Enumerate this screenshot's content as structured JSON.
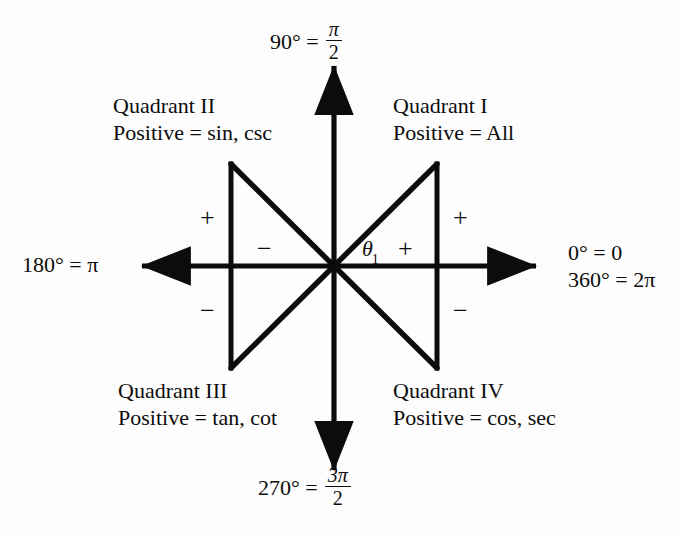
{
  "diagram": {
    "background_color": "#fdfdfd",
    "line_color": "#0c0c0c"
  },
  "axis_labels": {
    "top": {
      "name": "90-degrees-label",
      "degrees": "90° =",
      "radian_numerator": "π",
      "radian_denominator": "2"
    },
    "bottom": {
      "name": "270-degrees-label",
      "degrees": "270° =",
      "radian_numerator": "3π",
      "radian_denominator": "2"
    },
    "left": {
      "name": "180-degrees-label",
      "text": "180° = π"
    },
    "right": {
      "name": "0-and-360-degrees-label",
      "line1": "0° = 0",
      "line2": "360° = 2π"
    }
  },
  "quadrants": [
    {
      "id": "quadrant-1",
      "title": "Quadrant I",
      "positive": "Positive = All",
      "functions": "All"
    },
    {
      "id": "quadrant-2",
      "title": "Quadrant II",
      "positive": "Positive = sin, csc",
      "functions": "sin, csc"
    },
    {
      "id": "quadrant-3",
      "title": "Quadrant III",
      "positive": "Positive = tan, cot",
      "functions": "tan, cot"
    },
    {
      "id": "quadrant-4",
      "title": "Quadrant IV",
      "positive": "Positive = cos, sec",
      "functions": "cos, sec"
    }
  ],
  "signs": {
    "q2_outer": "+",
    "q2_inner": "−",
    "q1_outer": "+",
    "q1_inner": "+",
    "q3_outer": "−",
    "q4_outer": "−"
  },
  "angle": {
    "symbol": "θ",
    "subscript": "1"
  },
  "geometry": {
    "origin_x": 334,
    "origin_y": 266,
    "x_axis_left_tip": 130,
    "x_axis_right_tip": 548,
    "y_axis_top_tip": 54,
    "y_axis_bottom_tip": 482,
    "left_triangle_x": 231,
    "right_triangle_x": 437,
    "triangle_top_y": 164,
    "triangle_bottom_y": 368
  }
}
